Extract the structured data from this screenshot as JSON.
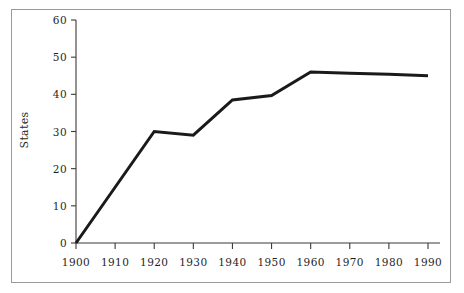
{
  "figure": {
    "background_color": "#ffffff",
    "frame_color": "#9a9a9a",
    "y_axis_title": "States"
  },
  "chart_data": {
    "type": "line",
    "title": "",
    "subtitle": "",
    "xlabel": "",
    "ylabel": "States",
    "x": [
      1900,
      1910,
      1920,
      1930,
      1940,
      1950,
      1960,
      1970,
      1980,
      1990
    ],
    "series": [
      {
        "name": "States",
        "color": "#1a1a1a",
        "line_width": 3,
        "values": [
          0,
          15,
          30,
          29,
          38.5,
          39.7,
          46,
          45.7,
          45.4,
          45
        ]
      }
    ],
    "xlim": [
      1900,
      1990
    ],
    "ylim": [
      0,
      60
    ],
    "xticks": [
      1900,
      1910,
      1920,
      1930,
      1940,
      1950,
      1960,
      1970,
      1980,
      1990
    ],
    "yticks": [
      0,
      10,
      20,
      30,
      40,
      50,
      60
    ],
    "xtick_labels": [
      "1900",
      "1910",
      "1920",
      "1930",
      "1940",
      "1950",
      "1960",
      "1970",
      "1980",
      "1990"
    ],
    "ytick_labels": [
      "0",
      "10",
      "20",
      "30",
      "40",
      "50",
      "60"
    ],
    "grid": false,
    "legend": false,
    "legend_position": "none",
    "markers": false,
    "annotations": []
  }
}
